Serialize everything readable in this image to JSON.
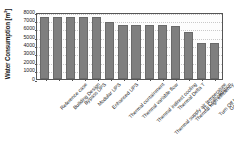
{
  "chart_data": {
    "type": "bar",
    "title": "",
    "xlabel": "",
    "ylabel": "Water Consumption [m³]",
    "ylabel_base": "Water Consumption [m",
    "ylabel_sup": "3",
    "ylabel_tail": "]",
    "ylim": [
      0,
      8000
    ],
    "ytick_step": 1000,
    "yticks": [
      "8000",
      "7000",
      "6000",
      "5000",
      "4000",
      "3000",
      "2000",
      "1000",
      "0"
    ],
    "grid": true,
    "legend": "none",
    "bar_color": "#7f7f7f",
    "categories": [
      "Reference case",
      "Building Design",
      "Bypass UPS",
      "Modular UPS",
      "Enhanced UPS",
      "Thermal containment",
      "Thermal variable flow",
      "Thermal indirect cooling",
      "Thermal supply air temperature",
      "Thermal Delta T",
      "Thermal high efficiency",
      "IT Consolidation",
      "Turn Off Idle Server",
      "Green Algorithm"
    ],
    "values": [
      7400,
      7400,
      7400,
      7400,
      7400,
      6700,
      6400,
      6400,
      6400,
      6400,
      6250,
      5600,
      4200,
      4200
    ]
  }
}
